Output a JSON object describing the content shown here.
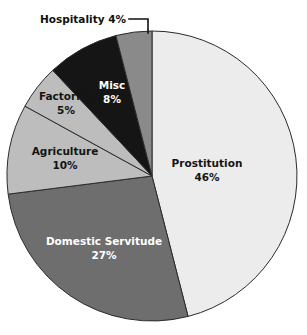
{
  "chart_data": {
    "type": "pie",
    "title": "",
    "subtitle": "",
    "xlabel": "",
    "ylabel": "",
    "legend_position": "none",
    "grid": false,
    "value_unit": "%",
    "start_angle_deg": 0,
    "direction": "clockwise",
    "categories": [
      "Prostitution",
      "Domestic Servitude",
      "Agriculture",
      "Factories",
      "Misc",
      "Hospitality"
    ],
    "values": [
      46,
      27,
      10,
      5,
      8,
      4
    ],
    "slices": [
      {
        "name": "Prostitution",
        "value": 46,
        "value_text": "46%",
        "color": "#ececec",
        "text_color": "#141414",
        "label_placement": "inside",
        "label_x": 207,
        "label_y": 167
      },
      {
        "name": "Domestic Servitude",
        "value": 27,
        "value_text": "27%",
        "color": "#6e6e6e",
        "text_color": "#ffffff",
        "label_placement": "inside",
        "label_x": 104,
        "label_y": 245
      },
      {
        "name": "Agriculture",
        "value": 10,
        "value_text": "10%",
        "color": "#bdbdbd",
        "text_color": "#141414",
        "label_placement": "inside",
        "label_x": 65,
        "label_y": 155
      },
      {
        "name": "Factories",
        "value": 5,
        "value_text": "5%",
        "color": "#bdbdbd",
        "text_color": "#141414",
        "label_placement": "inside",
        "label_x": 66,
        "label_y": 100
      },
      {
        "name": "Misc",
        "value": 8,
        "value_text": "8%",
        "color": "#151515",
        "text_color": "#ffffff",
        "label_placement": "inside",
        "label_x": 112,
        "label_y": 89
      },
      {
        "name": "Hospitality",
        "value": 4,
        "value_text": "4%",
        "color": "#8a8a8a",
        "text_color": "#141414",
        "label_placement": "outside",
        "label_text": "Hospitality 4%",
        "label_x": 126,
        "label_y": 23
      }
    ]
  },
  "geometry": {
    "center_x": 152,
    "center_y": 176,
    "radius": 145,
    "outline_color": "#2b2b2b",
    "background": "#ffffff"
  },
  "leader_line": {
    "points": "129,19 148,19 148,33"
  }
}
